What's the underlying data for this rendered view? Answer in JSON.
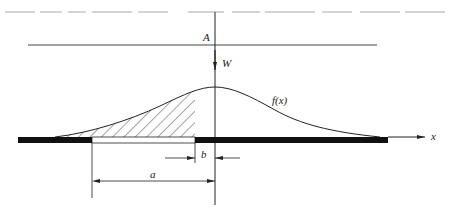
{
  "figure": {
    "type": "diagram",
    "labels": {
      "line_A": "A",
      "weight_arrow": "W",
      "curve": "f(x)",
      "x_axis": "x",
      "dim_a": "a",
      "dim_b": "b"
    },
    "colors": {
      "stroke": "#222222",
      "bar": "#111111",
      "hatch": "#333333",
      "cropped_text": "#cfcfcf"
    },
    "top_caption": {
      "visible": "cropped text line at top edge (illegible)"
    }
  }
}
